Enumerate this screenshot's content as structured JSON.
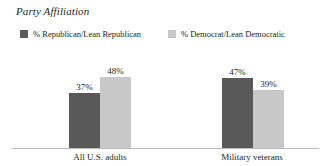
{
  "chart_data": {
    "type": "bar",
    "title": "Party Affiliation",
    "xlabel": "",
    "ylabel": "",
    "ylim": [
      0,
      100
    ],
    "grid": false,
    "legend_position": "top-left",
    "categories": [
      "All U.S. adults",
      "Military veterans"
    ],
    "series": [
      {
        "name": "% Republican/Lean Republican",
        "color": "#595959",
        "values": [
          37,
          47
        ],
        "value_labels": [
          "37%",
          "48%"
        ]
      },
      {
        "name": "% Democrat/Lean Democratic",
        "color": "#c8c8c8",
        "values": [
          48,
          39
        ],
        "value_labels": [
          "48%",
          "39%"
        ]
      }
    ],
    "bars": [
      {
        "group": "All U.S. adults",
        "series": "% Republican/Lean Republican",
        "value": 37,
        "label": "37%",
        "color": "#595959"
      },
      {
        "group": "All U.S. adults",
        "series": "% Democrat/Lean Democratic",
        "value": 48,
        "label": "48%",
        "color": "#c8c8c8"
      },
      {
        "group": "Military veterans",
        "series": "% Republican/Lean Republican",
        "value": 47,
        "label": "47%",
        "color": "#595959"
      },
      {
        "group": "Military veterans",
        "series": "% Democrat/Lean Democratic",
        "value": 39,
        "label": "39%",
        "color": "#c8c8c8"
      }
    ]
  },
  "title": "Party Affiliation",
  "legend": [
    {
      "label": "% Republican/Lean Republican",
      "color": "#595959"
    },
    {
      "label": "% Democrat/Lean Democratic",
      "color": "#c8c8c8"
    }
  ],
  "groups": [
    {
      "label": "All U.S. adults",
      "bars": [
        {
          "label": "37%",
          "color": "#595959"
        },
        {
          "label": "48%",
          "color": "#c8c8c8"
        }
      ]
    },
    {
      "label": "Military veterans",
      "bars": [
        {
          "label": "47%",
          "color": "#595959"
        },
        {
          "label": "39%",
          "color": "#c8c8c8"
        }
      ]
    }
  ],
  "colors": {
    "republican": "#595959",
    "democrat": "#c8c8c8",
    "axis": "#b9b9b9",
    "text": "#231f20",
    "background": "#ffffff"
  }
}
